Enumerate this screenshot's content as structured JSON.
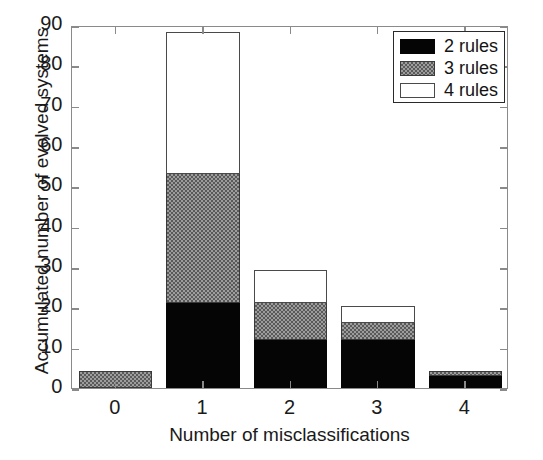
{
  "chart_data": {
    "type": "bar",
    "subtype": "stacked",
    "title": "",
    "xlabel": "Number of misclassifications",
    "ylabel": "Accumulated number of evolved systems",
    "categories": [
      "0",
      "1",
      "2",
      "3",
      "4"
    ],
    "xlim": [
      -0.5,
      4.5
    ],
    "ylim": [
      0,
      90
    ],
    "yticks": [
      0,
      10,
      20,
      30,
      40,
      50,
      60,
      70,
      80,
      90
    ],
    "ytick_labels": [
      "0",
      "10",
      "20",
      "30",
      "40",
      "50",
      "60",
      "70",
      "80",
      "90"
    ],
    "xticks": [
      0,
      1,
      2,
      3,
      4
    ],
    "xtick_labels": [
      "0",
      "1",
      "2",
      "3",
      "4"
    ],
    "grid": false,
    "legend_position": "top-right",
    "series": [
      {
        "name": "2 rules",
        "color": "#050505",
        "fill": "solid",
        "values": [
          0,
          21,
          12,
          12,
          3
        ]
      },
      {
        "name": "3 rules",
        "color": "#9d9d9d",
        "fill": "checker",
        "values": [
          4,
          32,
          9,
          4,
          1
        ]
      },
      {
        "name": "4 rules",
        "color": "#ffffff",
        "fill": "empty",
        "values": [
          0,
          35,
          8,
          4,
          0
        ]
      }
    ],
    "cumulative_tops": [
      {
        "category": "0",
        "total": 4
      },
      {
        "category": "1",
        "total": 88
      },
      {
        "category": "2",
        "total": 29
      },
      {
        "category": "3",
        "total": 20
      },
      {
        "category": "4",
        "total": 4
      }
    ]
  },
  "legend": {
    "entries": [
      {
        "label": "2 rules",
        "swatch": "black-solid"
      },
      {
        "label": "3 rules",
        "swatch": "gray-checker"
      },
      {
        "label": "4 rules",
        "swatch": "white-empty"
      }
    ]
  },
  "axes": {
    "x_title": "Number of misclassifications",
    "y_title": "Accumulated number of evolved systems"
  }
}
